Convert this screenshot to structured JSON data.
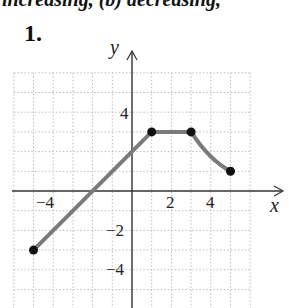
{
  "header": {
    "cutoff_text": "increasing, (b) decreasing,",
    "problem_number": "1."
  },
  "colors": {
    "curve": "#7a7a7a",
    "points": "#111111",
    "axis": "#333333",
    "grid": "#bdbdbd"
  },
  "chart_data": {
    "type": "line",
    "title": "",
    "xlabel": "x",
    "ylabel": "y",
    "xlim": [
      -6,
      6
    ],
    "ylim": [
      -6,
      6
    ],
    "grid": true,
    "x_tick_labels": [
      "-4",
      "2",
      "4"
    ],
    "y_tick_labels": [
      "4",
      "-2",
      "-4"
    ],
    "series": [
      {
        "name": "f(x)",
        "segments": [
          {
            "kind": "line",
            "from": [
              -5,
              -3
            ],
            "to": [
              1,
              3
            ]
          },
          {
            "kind": "line",
            "from": [
              1,
              3
            ],
            "to": [
              3,
              3
            ]
          },
          {
            "kind": "curve",
            "from": [
              3,
              3
            ],
            "to": [
              5,
              1
            ],
            "shape": "concave-down decreasing"
          }
        ],
        "points": [
          [
            -5,
            -3
          ],
          [
            1,
            3
          ],
          [
            3,
            3
          ],
          [
            5,
            1
          ]
        ],
        "x_intercept": -2,
        "y_intercept": 2
      }
    ]
  }
}
